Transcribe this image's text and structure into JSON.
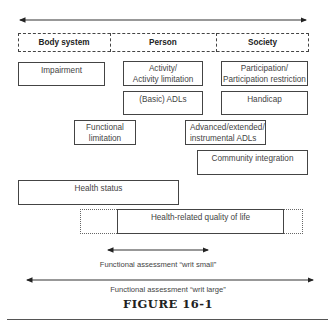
{
  "header": {
    "columns": [
      {
        "label": "Body system"
      },
      {
        "label": "Person"
      },
      {
        "label": "Society"
      }
    ]
  },
  "boxes": {
    "impairment": "Impairment",
    "activity_line1": "Activity/",
    "activity_line2": "Activity limitation",
    "participation_line1": "Participation/",
    "participation_line2": "Participation restriction",
    "basic_adls": "(Basic) ADLs",
    "handicap": "Handicap",
    "functional_line1": "Functional",
    "functional_line2": "limitation",
    "advanced_line1": "Advanced/extended/",
    "advanced_line2": "instrumental ADLs",
    "community": "Community integration",
    "health_status": "Health status",
    "hrqol": "Health-related quality of life"
  },
  "arrows": {
    "small_label": "Functional assessment “writ small”",
    "large_label": "Functional assessment “writ large”"
  },
  "figure": {
    "caption": "FIGURE 16-1"
  },
  "colors": {
    "line": "#444444",
    "text": "#444444"
  }
}
